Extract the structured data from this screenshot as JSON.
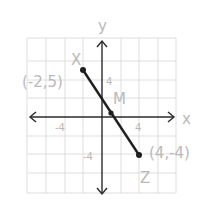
{
  "diagram": {
    "type": "coordinate-plane-segment",
    "axes": {
      "x_label": "x",
      "y_label": "y"
    },
    "ticks": {
      "x_pos": "4",
      "x_neg": "-4",
      "y_pos": "4",
      "y_neg": "-4"
    },
    "points": [
      {
        "name": "X",
        "coord_label": "(-2,5)",
        "x": -2,
        "y": 5
      },
      {
        "name": "M",
        "coord_label": "",
        "x": 1,
        "y": 0.5
      },
      {
        "name": "Z",
        "coord_label": "(4,-4)",
        "x": 4,
        "y": -4
      }
    ],
    "colors": {
      "segment": "#1e1e1e",
      "grid": "#d6d6d6",
      "labels": "#b9b9b9",
      "axes": "#2a2a2a"
    }
  }
}
